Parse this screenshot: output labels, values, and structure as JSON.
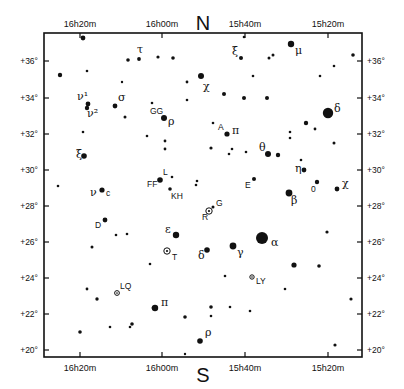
{
  "chart_data": {
    "type": "scatter",
    "compass": {
      "north": "N",
      "south": "S"
    },
    "frame": {
      "left": 44,
      "top": 33,
      "right": 362,
      "bottom": 357
    },
    "ra_ticks": [
      {
        "label": "16h20m",
        "x": 80
      },
      {
        "label": "16h00m",
        "x": 162
      },
      {
        "label": "15h40m",
        "x": 245
      },
      {
        "label": "15h20m",
        "x": 328
      }
    ],
    "dec_ticks": [
      {
        "label": "+36°",
        "y": 61
      },
      {
        "label": "+34°",
        "y": 98
      },
      {
        "label": "+32°",
        "y": 134
      },
      {
        "label": "+30°",
        "y": 170
      },
      {
        "label": "+28°",
        "y": 206
      },
      {
        "label": "+26°",
        "y": 242
      },
      {
        "label": "+24°",
        "y": 278
      },
      {
        "label": "+22°",
        "y": 314
      },
      {
        "label": "+20°",
        "y": 350
      }
    ],
    "stars": [
      {
        "x": 83,
        "y": 38,
        "r": 2.4
      },
      {
        "x": 60,
        "y": 75,
        "r": 2.2
      },
      {
        "x": 87,
        "y": 71,
        "r": 1.3
      },
      {
        "x": 128,
        "y": 60,
        "r": 1.8
      },
      {
        "x": 139,
        "y": 59,
        "r": 1.9,
        "label": "τ",
        "lx": 137,
        "ly": 53,
        "greek": true
      },
      {
        "x": 158,
        "y": 57,
        "r": 1.6
      },
      {
        "x": 173,
        "y": 58,
        "r": 1.8
      },
      {
        "x": 122,
        "y": 82,
        "r": 1.2
      },
      {
        "x": 201,
        "y": 76,
        "r": 3.0,
        "label": "χ",
        "lx": 203,
        "ly": 90,
        "greek": true
      },
      {
        "x": 244,
        "y": 37,
        "r": 1.3
      },
      {
        "x": 241,
        "y": 58,
        "r": 2.0,
        "label": "ξ",
        "lx": 232,
        "ly": 55,
        "greek": true
      },
      {
        "x": 269,
        "y": 58,
        "r": 1.5
      },
      {
        "x": 273,
        "y": 55,
        "r": 1.5
      },
      {
        "x": 291,
        "y": 44,
        "r": 3.2,
        "label": "μ",
        "lx": 295,
        "ly": 54,
        "greek": true
      },
      {
        "x": 353,
        "y": 55,
        "r": 1.8
      },
      {
        "x": 334,
        "y": 66,
        "r": 1.3
      },
      {
        "x": 320,
        "y": 76,
        "r": 1.3
      },
      {
        "x": 253,
        "y": 76,
        "r": 1.3
      },
      {
        "x": 187,
        "y": 82,
        "r": 1.4
      },
      {
        "x": 88,
        "y": 104,
        "r": 2.4,
        "label": "ν¹",
        "lx": 77,
        "ly": 100,
        "greek": true
      },
      {
        "x": 87,
        "y": 108,
        "r": 2.2,
        "label": "ν²",
        "lx": 87,
        "ly": 117,
        "greek": true
      },
      {
        "x": 115,
        "y": 106,
        "r": 2.4,
        "label": "σ",
        "lx": 118,
        "ly": 101,
        "greek": true
      },
      {
        "x": 125,
        "y": 117,
        "r": 1.5
      },
      {
        "x": 152,
        "y": 103,
        "r": 1.3
      },
      {
        "x": 164,
        "y": 118,
        "r": 3.0,
        "label": "ρ",
        "lx": 168,
        "ly": 125,
        "greek": true,
        "label2": "GG",
        "l2x": 150,
        "l2y": 114
      },
      {
        "x": 187,
        "y": 100,
        "r": 1.3
      },
      {
        "x": 244,
        "y": 98,
        "r": 2.0
      },
      {
        "x": 224,
        "y": 94,
        "r": 2.0
      },
      {
        "x": 267,
        "y": 98,
        "r": 2.0
      },
      {
        "x": 328,
        "y": 113,
        "r": 5.2,
        "label": "δ",
        "lx": 334,
        "ly": 112,
        "greek": true
      },
      {
        "x": 306,
        "y": 123,
        "r": 2.2
      },
      {
        "x": 315,
        "y": 129,
        "r": 1.4
      },
      {
        "x": 290,
        "y": 132,
        "r": 1.3
      },
      {
        "x": 83,
        "y": 132,
        "r": 1.3
      },
      {
        "x": 84,
        "y": 156,
        "r": 2.8,
        "label": "ξ",
        "lx": 76,
        "ly": 158,
        "greek": true
      },
      {
        "x": 147,
        "y": 136,
        "r": 1.3
      },
      {
        "x": 165,
        "y": 141,
        "r": 1.4
      },
      {
        "x": 165,
        "y": 149,
        "r": 1.4
      },
      {
        "x": 213,
        "y": 123,
        "r": 1.3
      },
      {
        "x": 227,
        "y": 134,
        "r": 2.6,
        "label": "π",
        "lx": 232,
        "ly": 134,
        "greek": true,
        "label2": "A",
        "l2x": 218,
        "l2y": 130
      },
      {
        "x": 211,
        "y": 148,
        "r": 1.6
      },
      {
        "x": 232,
        "y": 149,
        "r": 1.3
      },
      {
        "x": 229,
        "y": 154,
        "r": 1.3
      },
      {
        "x": 246,
        "y": 152,
        "r": 1.3
      },
      {
        "x": 268,
        "y": 154,
        "r": 3.0,
        "label": "θ",
        "lx": 259,
        "ly": 151,
        "greek": true
      },
      {
        "x": 278,
        "y": 155,
        "r": 2.2
      },
      {
        "x": 290,
        "y": 138,
        "r": 1.3
      },
      {
        "x": 301,
        "y": 160,
        "r": 1.3
      },
      {
        "x": 334,
        "y": 143,
        "r": 1.5
      },
      {
        "x": 304,
        "y": 170,
        "r": 2.4,
        "label": "η",
        "lx": 295,
        "ly": 172,
        "greek": true
      },
      {
        "x": 317,
        "y": 182,
        "r": 2.2,
        "label": "0",
        "lx": 311,
        "ly": 192,
        "greek": false
      },
      {
        "x": 337,
        "y": 189,
        "r": 2.4,
        "label": "χ",
        "lx": 342,
        "ly": 187,
        "greek": true
      },
      {
        "x": 289,
        "y": 193,
        "r": 3.4,
        "label": "β",
        "lx": 291,
        "ly": 204,
        "greek": true
      },
      {
        "x": 254,
        "y": 179,
        "r": 2.0,
        "label": "E",
        "lx": 245,
        "ly": 188,
        "greek": false
      },
      {
        "x": 197,
        "y": 181,
        "r": 1.3
      },
      {
        "x": 58,
        "y": 186,
        "r": 1.3
      },
      {
        "x": 102,
        "y": 190,
        "r": 2.6,
        "label": "ν",
        "lx": 90,
        "ly": 196,
        "greek": true,
        "label2": "c",
        "l2x": 106,
        "l2y": 196
      },
      {
        "x": 160,
        "y": 180,
        "r": 2.8,
        "label": "L",
        "lx": 163,
        "ly": 175,
        "greek": false,
        "label2": "FF",
        "l2x": 147,
        "l2y": 187
      },
      {
        "x": 172,
        "y": 177,
        "r": 1.3
      },
      {
        "x": 170,
        "y": 189,
        "r": 1.8,
        "label": "KH",
        "lx": 171,
        "ly": 199,
        "greek": false
      },
      {
        "x": 196,
        "y": 185,
        "r": 1.3
      },
      {
        "x": 105,
        "y": 220,
        "r": 2.4,
        "label": "D",
        "lx": 95,
        "ly": 228,
        "greek": false
      },
      {
        "x": 116,
        "y": 235,
        "r": 1.3
      },
      {
        "x": 127,
        "y": 234,
        "r": 1.3
      },
      {
        "x": 176,
        "y": 235,
        "r": 3.2,
        "label": "ε",
        "lx": 165,
        "ly": 233,
        "greek": true
      },
      {
        "x": 92,
        "y": 247,
        "r": 1.5
      },
      {
        "x": 150,
        "y": 264,
        "r": 1.3
      },
      {
        "x": 213,
        "y": 207,
        "r": 1.5,
        "label": "G",
        "lx": 216,
        "ly": 206,
        "greek": false
      },
      {
        "x": 262,
        "y": 238,
        "r": 6.0,
        "label": "α",
        "lx": 271,
        "ly": 246,
        "greek": true
      },
      {
        "x": 233,
        "y": 246,
        "r": 3.4,
        "label": "γ",
        "lx": 237,
        "ly": 256,
        "greek": true
      },
      {
        "x": 207,
        "y": 250,
        "r": 2.8,
        "label": "δ",
        "lx": 198,
        "ly": 259,
        "greek": true
      },
      {
        "x": 327,
        "y": 232,
        "r": 1.6
      },
      {
        "x": 294,
        "y": 265,
        "r": 2.6
      },
      {
        "x": 319,
        "y": 266,
        "r": 1.8
      },
      {
        "x": 225,
        "y": 276,
        "r": 1.3
      },
      {
        "x": 285,
        "y": 289,
        "r": 1.3
      },
      {
        "x": 351,
        "y": 299,
        "r": 1.6
      },
      {
        "x": 87,
        "y": 289,
        "r": 1.4
      },
      {
        "x": 97,
        "y": 299,
        "r": 1.7
      },
      {
        "x": 153,
        "y": 308,
        "r": 1.4
      },
      {
        "x": 155,
        "y": 308,
        "r": 3.2,
        "label": "π",
        "lx": 161,
        "ly": 306,
        "greek": true
      },
      {
        "x": 110,
        "y": 327,
        "r": 1.3
      },
      {
        "x": 132,
        "y": 324,
        "r": 1.8
      },
      {
        "x": 80,
        "y": 332,
        "r": 1.8
      },
      {
        "x": 130,
        "y": 327,
        "r": 1.3
      },
      {
        "x": 211,
        "y": 307,
        "r": 1.8
      },
      {
        "x": 230,
        "y": 307,
        "r": 1.3
      },
      {
        "x": 250,
        "y": 311,
        "r": 1.3
      },
      {
        "x": 211,
        "y": 316,
        "r": 1.3
      },
      {
        "x": 200,
        "y": 341,
        "r": 2.8,
        "label": "ρ",
        "lx": 205,
        "ly": 336,
        "greek": true
      },
      {
        "x": 185,
        "y": 354,
        "r": 1.2
      },
      {
        "x": 335,
        "y": 345,
        "r": 1.6
      },
      {
        "x": 185,
        "y": 317,
        "r": 1.8
      }
    ],
    "variables": [
      {
        "x": 209,
        "y": 211,
        "r": 3.2,
        "label": "R",
        "lx": 202,
        "ly": 220
      },
      {
        "x": 167,
        "y": 251,
        "r": 3.2,
        "label": "T",
        "lx": 172,
        "ly": 260
      },
      {
        "x": 117,
        "y": 293,
        "r": 2.4,
        "label": "LQ",
        "lx": 120,
        "ly": 289
      },
      {
        "x": 252,
        "y": 277,
        "r": 2.2,
        "label": "LY",
        "lx": 256,
        "ly": 284
      }
    ]
  }
}
